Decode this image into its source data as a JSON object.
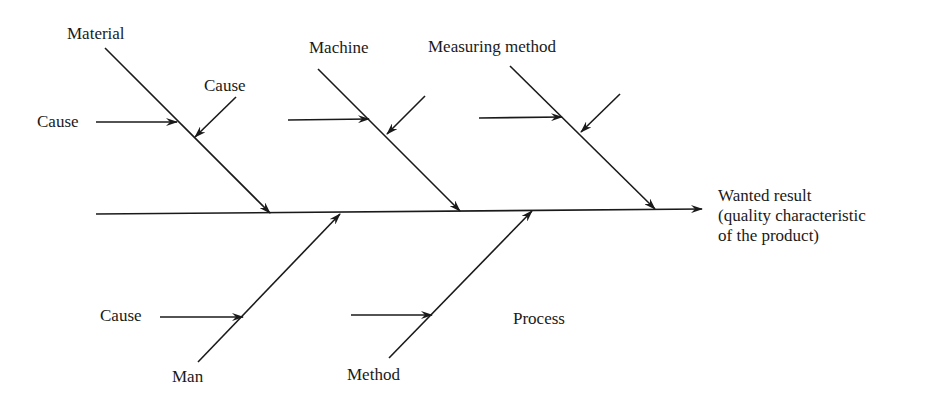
{
  "diagram": {
    "type": "fishbone",
    "effect": {
      "line1": "Wanted result",
      "line2": "(quality characteristic",
      "line3": "of the product)"
    },
    "categories": {
      "material": "Material",
      "machine": "Machine",
      "measuring_method": "Measuring method",
      "man": "Man",
      "method": "Method"
    },
    "cause_labels": {
      "material_left": "Cause",
      "material_top": "Cause",
      "man_left": "Cause"
    },
    "process_label": "Process",
    "line_color": "#1a1a1a"
  }
}
